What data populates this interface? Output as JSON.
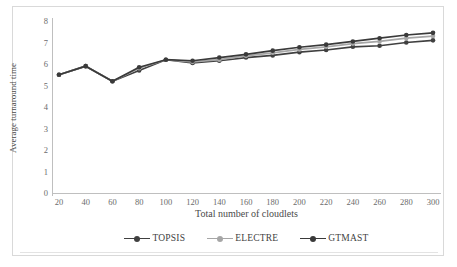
{
  "chart_data": {
    "type": "line",
    "title": "",
    "xlabel": "Total number of cloudlets",
    "ylabel": "Average turnaround time",
    "x": [
      20,
      40,
      60,
      80,
      100,
      120,
      140,
      160,
      180,
      200,
      220,
      240,
      260,
      280,
      300
    ],
    "xtick_labels": [
      "20",
      "40",
      "60",
      "80",
      "100",
      "120",
      "140",
      "160",
      "180",
      "200",
      "220",
      "240",
      "260",
      "280",
      "300"
    ],
    "ytick_labels": [
      "0",
      "1",
      "2",
      "3",
      "4",
      "5",
      "6",
      "7",
      "8"
    ],
    "ylim": [
      0,
      8
    ],
    "xlim": [
      20,
      300
    ],
    "grid": false,
    "legend_position": "bottom",
    "series": [
      {
        "name": "TOPSIS",
        "color": "#404040",
        "marker": "circle",
        "values": [
          5.5,
          5.9,
          5.2,
          5.7,
          6.2,
          6.05,
          6.15,
          6.3,
          6.4,
          6.55,
          6.65,
          6.8,
          6.85,
          7.0,
          7.1
        ]
      },
      {
        "name": "ELECTRE",
        "color": "#a6a6a6",
        "marker": "circle",
        "values": [
          5.5,
          5.9,
          5.2,
          5.8,
          6.2,
          6.1,
          6.2,
          6.38,
          6.52,
          6.68,
          6.8,
          6.95,
          7.05,
          7.2,
          7.3
        ]
      },
      {
        "name": "GTMAST",
        "color": "#3a3a3a",
        "marker": "circle",
        "values": [
          5.5,
          5.9,
          5.2,
          5.85,
          6.2,
          6.15,
          6.3,
          6.45,
          6.62,
          6.78,
          6.9,
          7.05,
          7.2,
          7.35,
          7.45
        ]
      }
    ]
  },
  "legend": {
    "items": [
      {
        "label": "TOPSIS"
      },
      {
        "label": "ELECTRE"
      },
      {
        "label": "GTMAST"
      }
    ]
  },
  "axes": {
    "x_title": "Total number of cloudlets",
    "y_title": "Average turnaround time"
  }
}
